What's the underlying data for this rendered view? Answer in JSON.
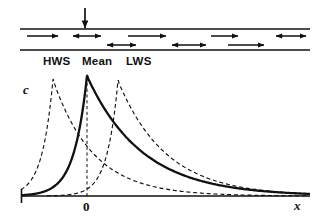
{
  "figure": {
    "title_visible": false,
    "colors": {
      "ink": "#111111",
      "line": "#111111",
      "dashed": "#111111"
    }
  },
  "channel": {
    "name": "estuary-channel",
    "top_line_y": 29,
    "bottom_line_y": 50,
    "x_start": 20,
    "x_end": 310,
    "inflow_arrow": {
      "label": "freshwater-inflow",
      "x": 85,
      "y_from": 8,
      "y_to": 29
    },
    "flow_arrows": [
      {
        "type": "single",
        "x1": 27,
        "x2": 58,
        "y": 36
      },
      {
        "type": "double",
        "x1": 73,
        "x2": 101,
        "y": 36
      },
      {
        "type": "double",
        "x1": 107,
        "x2": 136,
        "y": 45
      },
      {
        "type": "single",
        "x1": 128,
        "x2": 166,
        "y": 36
      },
      {
        "type": "double",
        "x1": 172,
        "x2": 206,
        "y": 45
      },
      {
        "type": "single",
        "x1": 211,
        "x2": 238,
        "y": 36
      },
      {
        "type": "single",
        "x1": 228,
        "x2": 264,
        "y": 45
      },
      {
        "type": "double",
        "x1": 276,
        "x2": 306,
        "y": 36
      }
    ]
  },
  "tide_labels": [
    {
      "text": "HWS",
      "x": 43,
      "y": 56
    },
    {
      "text": "Mean",
      "x": 82,
      "y": 56
    },
    {
      "text": "LWS",
      "x": 126,
      "y": 56
    }
  ],
  "plot": {
    "y_axis_label": "c",
    "x_axis_label": "x",
    "origin_tick_label": "0",
    "axis_y": 196,
    "axis_x_start": 21,
    "axis_x_end": 310,
    "origin_x": 87
  },
  "chart_data": {
    "type": "line",
    "title": "",
    "xlabel": "x",
    "ylabel": "c",
    "xlim": [
      -66,
      223
    ],
    "ylim": [
      0,
      1
    ],
    "grid": false,
    "legend": null,
    "xticks": [
      {
        "value": 0,
        "label": "0"
      }
    ],
    "annotations": [
      {
        "text": "HWS",
        "x": -35,
        "note": "high water slack peak"
      },
      {
        "text": "Mean",
        "x": 0,
        "note": "mean position peak"
      },
      {
        "text": "LWS",
        "x": 30,
        "note": "low water slack peak"
      }
    ],
    "series": [
      {
        "name": "HWS",
        "style": "dashed",
        "peak_x": -34,
        "peak_y": 0.97,
        "rise_scale": 11,
        "decay_scale": 40,
        "points_x": [
          -66,
          -60,
          -55,
          -50,
          -46,
          -42,
          -39,
          -36,
          -34,
          -32,
          -29,
          -26,
          -22,
          -17,
          -11,
          -4,
          5,
          16,
          30,
          46,
          65,
          88,
          115,
          145,
          180,
          223
        ],
        "points_y": [
          0.06,
          0.11,
          0.18,
          0.3,
          0.44,
          0.62,
          0.8,
          0.93,
          0.97,
          0.93,
          0.83,
          0.73,
          0.61,
          0.49,
          0.38,
          0.29,
          0.21,
          0.15,
          0.1,
          0.07,
          0.045,
          0.03,
          0.02,
          0.013,
          0.008,
          0.004
        ]
      },
      {
        "name": "Mean",
        "style": "solid",
        "peak_x": 0,
        "peak_y": 1.0,
        "rise_scale": 13,
        "decay_scale": 55,
        "points_x": [
          -66,
          -58,
          -50,
          -43,
          -36,
          -30,
          -24,
          -18,
          -12,
          -7,
          -3,
          0,
          4,
          10,
          18,
          28,
          42,
          58,
          78,
          102,
          130,
          160,
          192,
          223
        ],
        "points_y": [
          0.01,
          0.02,
          0.035,
          0.06,
          0.1,
          0.16,
          0.24,
          0.35,
          0.5,
          0.68,
          0.88,
          1.0,
          0.92,
          0.8,
          0.67,
          0.54,
          0.4,
          0.29,
          0.2,
          0.13,
          0.08,
          0.05,
          0.03,
          0.02
        ]
      },
      {
        "name": "LWS",
        "style": "dashed",
        "peak_x": 31,
        "peak_y": 0.96,
        "rise_scale": 11,
        "decay_scale": 48,
        "points_x": [
          -20,
          -12,
          -5,
          2,
          8,
          14,
          19,
          24,
          28,
          31,
          34,
          38,
          44,
          52,
          62,
          76,
          94,
          116,
          142,
          170,
          196,
          223
        ],
        "points_y": [
          0.01,
          0.02,
          0.04,
          0.07,
          0.12,
          0.2,
          0.32,
          0.5,
          0.76,
          0.96,
          0.9,
          0.79,
          0.66,
          0.53,
          0.41,
          0.3,
          0.21,
          0.14,
          0.09,
          0.055,
          0.035,
          0.02
        ]
      }
    ]
  }
}
